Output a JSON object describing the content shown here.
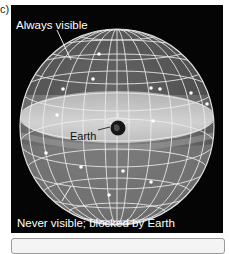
{
  "figure": {
    "panel_label": "c)",
    "labels": {
      "always_visible": "Always visible",
      "never_visible": "Never visible; blocked by Earth",
      "earth": "Earth"
    },
    "colors": {
      "background": "#050505",
      "sphere_upper": "#6a6a6a",
      "sphere_lower": "#8a8a8a",
      "horizon_band": "#c8c8c8",
      "grid_lines": "#e8e8e8",
      "stars": "#ffffff",
      "earth": "#1a1a1a"
    }
  }
}
